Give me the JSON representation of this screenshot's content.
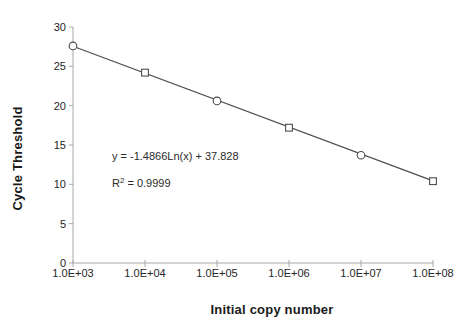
{
  "chart_data": {
    "type": "scatter",
    "title": "",
    "xlabel": "Initial copy number",
    "ylabel": "Cycle Threshold",
    "x_scale": "log",
    "x_tick_labels": [
      "1.0E+03",
      "1.0E+04",
      "1.0E+05",
      "1.0E+06",
      "1.0E+07",
      "1.0E+08"
    ],
    "x_tick_values": [
      1000,
      10000,
      100000,
      1000000,
      10000000,
      100000000
    ],
    "ylim": [
      0,
      30
    ],
    "y_tick_step": 5,
    "y_tick_labels": [
      "0",
      "5",
      "10",
      "15",
      "20",
      "25",
      "30"
    ],
    "grid": false,
    "legend": "none",
    "series": [
      {
        "name": "circle-series",
        "marker": "circle",
        "x": [
          1000,
          100000,
          10000000
        ],
        "y": [
          27.6,
          20.6,
          13.7
        ]
      },
      {
        "name": "square-series",
        "marker": "square",
        "x": [
          10000,
          1000000,
          100000000
        ],
        "y": [
          24.2,
          17.2,
          10.4
        ]
      }
    ],
    "trendline": {
      "model": "logarithmic",
      "slope": -1.4866,
      "intercept": 37.828,
      "r_squared": 0.9999
    },
    "annotations": {
      "equation": "y = -1.4866Ln(x) + 37.828",
      "r2_base": "R",
      "r2_sup": "2",
      "r2_rest": " = 0.9999"
    },
    "colors": {
      "axis": "#a8a8a8",
      "line": "#4d4d4d",
      "marker_stroke": "#4d4d4d",
      "marker_fill": "#ffffff",
      "text": "#262626"
    }
  }
}
